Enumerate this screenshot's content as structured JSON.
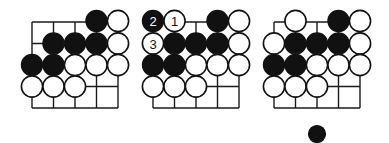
{
  "diagram": {
    "type": "go-problem-sequence",
    "grid_spacing": 21.5,
    "stone_radius": 10.6,
    "colors": {
      "black": "#111111",
      "white": "#ffffff",
      "line": "#1a1a1a"
    },
    "boards": [
      {
        "id": "board-1",
        "origin": [
          32,
          22
        ],
        "cols": 5,
        "rows": 5,
        "stones": [
          {
            "col": 3,
            "row": 0,
            "color": "black"
          },
          {
            "col": 4,
            "row": 0,
            "color": "white"
          },
          {
            "col": 1,
            "row": 1,
            "color": "black"
          },
          {
            "col": 2,
            "row": 1,
            "color": "black"
          },
          {
            "col": 3,
            "row": 1,
            "color": "black"
          },
          {
            "col": 4,
            "row": 1,
            "color": "white"
          },
          {
            "col": 0,
            "row": 2,
            "color": "black"
          },
          {
            "col": 1,
            "row": 2,
            "color": "black"
          },
          {
            "col": 2,
            "row": 2,
            "color": "white"
          },
          {
            "col": 3,
            "row": 2,
            "color": "white"
          },
          {
            "col": 4,
            "row": 2,
            "color": "white"
          },
          {
            "col": 0,
            "row": 3,
            "color": "white"
          },
          {
            "col": 1,
            "row": 3,
            "color": "white"
          },
          {
            "col": 2,
            "row": 3,
            "color": "white"
          }
        ]
      },
      {
        "id": "board-2",
        "origin": [
          153,
          22
        ],
        "cols": 5,
        "rows": 5,
        "stones": [
          {
            "col": 0,
            "row": 0,
            "color": "black",
            "label": "2"
          },
          {
            "col": 1,
            "row": 0,
            "color": "white",
            "label": "1"
          },
          {
            "col": 3,
            "row": 0,
            "color": "black"
          },
          {
            "col": 4,
            "row": 0,
            "color": "white"
          },
          {
            "col": 0,
            "row": 1,
            "color": "white",
            "label": "3"
          },
          {
            "col": 1,
            "row": 1,
            "color": "black"
          },
          {
            "col": 2,
            "row": 1,
            "color": "black"
          },
          {
            "col": 3,
            "row": 1,
            "color": "black"
          },
          {
            "col": 4,
            "row": 1,
            "color": "white"
          },
          {
            "col": 0,
            "row": 2,
            "color": "black"
          },
          {
            "col": 1,
            "row": 2,
            "color": "black"
          },
          {
            "col": 2,
            "row": 2,
            "color": "white"
          },
          {
            "col": 3,
            "row": 2,
            "color": "white"
          },
          {
            "col": 4,
            "row": 2,
            "color": "white"
          },
          {
            "col": 0,
            "row": 3,
            "color": "white"
          },
          {
            "col": 1,
            "row": 3,
            "color": "white"
          },
          {
            "col": 2,
            "row": 3,
            "color": "white"
          }
        ]
      },
      {
        "id": "board-3",
        "origin": [
          274,
          22
        ],
        "cols": 5,
        "rows": 5,
        "stones": [
          {
            "col": 1,
            "row": 0,
            "color": "white"
          },
          {
            "col": 3,
            "row": 0,
            "color": "black"
          },
          {
            "col": 4,
            "row": 0,
            "color": "white"
          },
          {
            "col": 0,
            "row": 1,
            "color": "white"
          },
          {
            "col": 1,
            "row": 1,
            "color": "black"
          },
          {
            "col": 2,
            "row": 1,
            "color": "black"
          },
          {
            "col": 3,
            "row": 1,
            "color": "black"
          },
          {
            "col": 4,
            "row": 1,
            "color": "white"
          },
          {
            "col": 0,
            "row": 2,
            "color": "black"
          },
          {
            "col": 1,
            "row": 2,
            "color": "black"
          },
          {
            "col": 2,
            "row": 2,
            "color": "white"
          },
          {
            "col": 3,
            "row": 2,
            "color": "white"
          },
          {
            "col": 4,
            "row": 2,
            "color": "white"
          },
          {
            "col": 0,
            "row": 3,
            "color": "white"
          },
          {
            "col": 1,
            "row": 3,
            "color": "white"
          },
          {
            "col": 2,
            "row": 3,
            "color": "white"
          }
        ],
        "extra_stone": {
          "x": 317,
          "y": 134,
          "r": 8.5,
          "color": "black"
        }
      }
    ]
  }
}
